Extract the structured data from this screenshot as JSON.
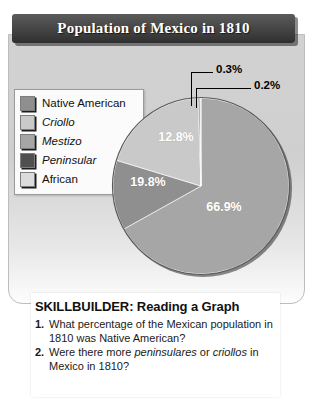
{
  "title": "Population of Mexico in 1810",
  "legend": {
    "items": [
      {
        "label": "Native American",
        "color": "#8f8f8f",
        "italic": false
      },
      {
        "label": "Criollo",
        "color": "#c9c9c9",
        "italic": true
      },
      {
        "label": "Mestizo",
        "color": "#a6a6a6",
        "italic": true
      },
      {
        "label": "Peninsular",
        "color": "#4f4f4f",
        "italic": true
      },
      {
        "label": "African",
        "color": "#dcdcdc",
        "italic": false
      }
    ]
  },
  "chart_data": {
    "type": "pie",
    "title": "Population of Mexico in 1810",
    "start_angle_deg": 0,
    "direction": "clockwise",
    "categories": [
      "Mestizo",
      "Native American",
      "Criollo",
      "Peninsular",
      "African"
    ],
    "values": [
      66.9,
      12.8,
      19.8,
      0.3,
      0.2
    ],
    "labels": [
      "66.9%",
      "12.8%",
      "19.8%",
      "0.3%",
      "0.2%"
    ],
    "colors": [
      "#a6a6a6",
      "#8f8f8f",
      "#c9c9c9",
      "#4f4f4f",
      "#dcdcdc"
    ],
    "inside_labels": [
      {
        "text": "66.9%",
        "x": 120,
        "y": 123
      },
      {
        "text": "12.8%",
        "x": 72,
        "y": 53
      },
      {
        "text": "19.8%",
        "x": 44,
        "y": 98
      }
    ],
    "callouts": [
      {
        "text": "0.3%",
        "series": "Peninsular"
      },
      {
        "text": "0.2%",
        "series": "African"
      }
    ],
    "legend_position": "left",
    "grid": false
  },
  "skillbuilder": {
    "heading": "SKILLBUILDER: Reading a Graph",
    "questions": [
      {
        "num": "1.",
        "parts": [
          {
            "text": "What percentage of the Mexican population in 1810 was Native American?",
            "italic": false
          }
        ]
      },
      {
        "num": "2.",
        "parts": [
          {
            "text": "Were there more ",
            "italic": false
          },
          {
            "text": "peninsulares",
            "italic": true
          },
          {
            "text": " or ",
            "italic": false
          },
          {
            "text": "criollos",
            "italic": true
          },
          {
            "text": " in Mexico in 1810?",
            "italic": false
          }
        ]
      }
    ]
  }
}
